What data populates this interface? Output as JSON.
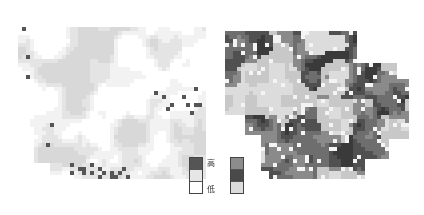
{
  "maps": [
    {
      "id": "left",
      "cols": 48,
      "rows": 44,
      "cell": 4,
      "palette": [
        "#ffffff",
        "#f2f2f2",
        "#e4e4e4",
        "#d8d8d8",
        "#555555"
      ],
      "style": "sparse-light"
    },
    {
      "id": "right",
      "cols": 48,
      "rows": 44,
      "cell": 4,
      "palette": [
        "#f4f4f4",
        "#dcdcdc",
        "#c8c8c8",
        "#8a8a8a",
        "#6e6e6e",
        "#505050",
        "#3a3a3a"
      ],
      "style": "dense-dark"
    }
  ],
  "legends": {
    "left": {
      "swatches": [
        {
          "level": "high",
          "color": "#555555"
        },
        {
          "level": "mid",
          "color": "#e6e6e6"
        },
        {
          "level": "low",
          "color": "#ffffff"
        }
      ]
    },
    "right": {
      "swatches": [
        {
          "level": "high",
          "color": "#8c8c8c"
        },
        {
          "level": "mid",
          "color": "#4a4a4a"
        },
        {
          "level": "low",
          "color": "#dcdcdc"
        }
      ]
    },
    "label_high": "高",
    "label_low": "低"
  }
}
